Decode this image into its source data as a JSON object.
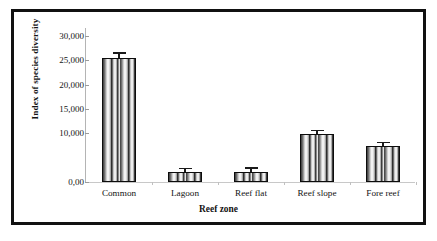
{
  "chart_data": {
    "type": "bar",
    "title": "",
    "subtitle": "",
    "xlabel": "Reef zone",
    "ylabel": "Index of species diversity",
    "categories": [
      "Common",
      "Lagoon",
      "Reef flat",
      "Reef slope",
      "Fore reef"
    ],
    "values": [
      25500,
      2000,
      2100,
      9800,
      7400
    ],
    "errors": [
      900,
      300,
      350,
      450,
      350
    ],
    "ytick_labels": [
      "30,000",
      "25,000",
      "20,000",
      "15,000",
      "10,000",
      "0,00"
    ],
    "ytick_values": [
      30000,
      25000,
      20000,
      15000,
      10000,
      0
    ],
    "ylim": [
      0,
      30000
    ],
    "grid": false,
    "legend": "none",
    "bar_fill": "vertical-striped-gradient",
    "bar_edge_color": "#0c0c0c",
    "error_bar_color": "#1a1a1a"
  },
  "figure": {
    "frame_color": "#111111",
    "background": "#ffffff"
  }
}
